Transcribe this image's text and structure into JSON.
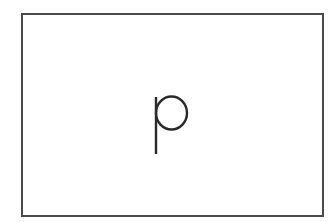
{
  "card": {
    "letter": "p",
    "border_color": "#4a4a4a",
    "letter_color": "#2a2a2a",
    "background_color": "#ffffff"
  }
}
